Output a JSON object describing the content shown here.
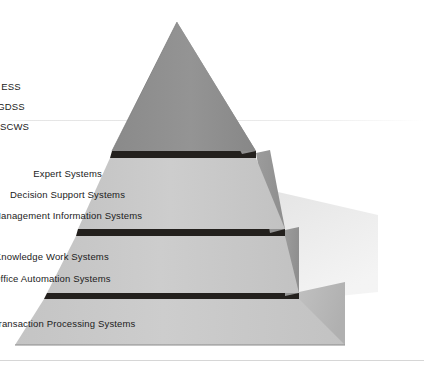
{
  "diagram": {
    "shape": "pyramid",
    "colors": {
      "background": "#ffffff",
      "apex_face": "#8e8e8e",
      "tier_face": "#c9c9c9",
      "side_face_dark": "#9a9a9a",
      "side_face_light": "#b4b4b4",
      "divider": "#23201d",
      "outline": "#6f6f6f",
      "text": "#1b1b1b",
      "hairline": "#e2e2e2"
    },
    "tiers": [
      {
        "id": "tier-1",
        "name": "strategic-level",
        "labels": [
          "ESS",
          "GDSS",
          "CSCWS"
        ]
      },
      {
        "id": "tier-2",
        "name": "management-level",
        "labels": [
          "Expert Systems",
          "Decision Support Systems",
          "Management Information Systems"
        ]
      },
      {
        "id": "tier-3",
        "name": "knowledge-level",
        "labels": [
          "Knowledge Work Systems",
          "Office Automation Systems"
        ]
      },
      {
        "id": "tier-4",
        "name": "operational-level",
        "labels": [
          "Transaction Processing Systems"
        ]
      }
    ]
  }
}
